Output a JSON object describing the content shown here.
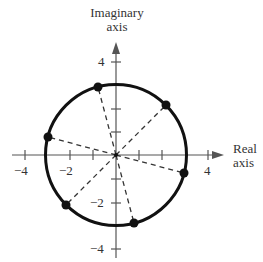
{
  "diagram": {
    "type": "complex-plane",
    "x_axis_label_line1": "Real",
    "x_axis_label_line2": "axis",
    "y_axis_label_line1": "Imaginary",
    "y_axis_label_line2": "axis",
    "x_ticks": [
      {
        "value": -4,
        "label": "−4"
      },
      {
        "value": -2,
        "label": "−2"
      },
      {
        "value": 4,
        "label": "4"
      }
    ],
    "y_ticks": [
      {
        "value": 4,
        "label": "4"
      },
      {
        "value": -2,
        "label": "−2"
      },
      {
        "value": -4,
        "label": "−4"
      }
    ],
    "circle_radius": 3,
    "points_angles_deg": [
      45,
      105,
      165,
      225,
      285,
      345
    ],
    "colors": {
      "stroke": "#111111",
      "axis": "#555555"
    }
  }
}
